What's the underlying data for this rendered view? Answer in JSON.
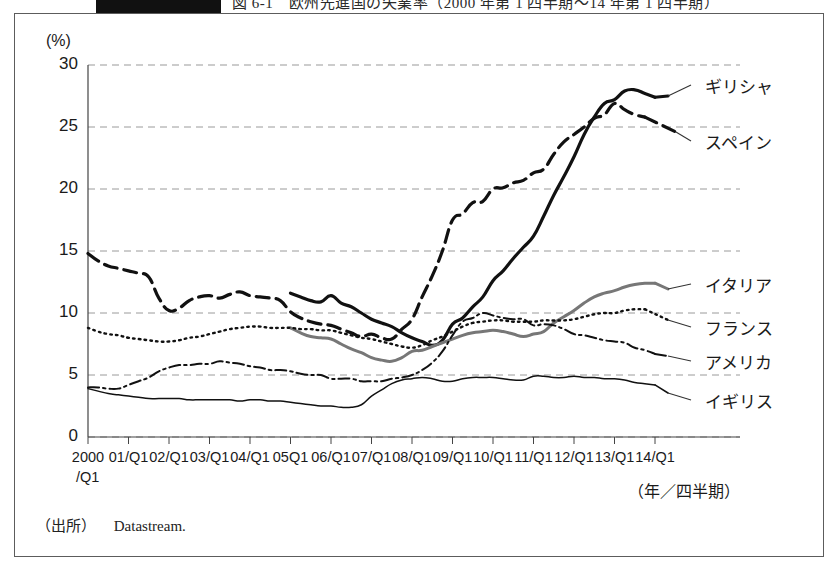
{
  "caption": {
    "tab_text": "",
    "title": "図 6-1　欧州先進国の失業率（2000 年第 1 四半期～14 年第 1 四半期）"
  },
  "axes": {
    "y_unit": "(%)",
    "y_ticks": [
      "30",
      "25",
      "20",
      "15",
      "10",
      "5",
      "0"
    ],
    "x_ticks": [
      "2000",
      "01/Q1",
      "02/Q1",
      "03/Q1",
      "04/Q1",
      "05Q1",
      "06/Q1",
      "07/Q1",
      "08/Q1",
      "09/Q1",
      "10/Q1",
      "11/Q1",
      "12/Q1",
      "13/Q1",
      "14/Q1"
    ],
    "x_first_sub": "/Q1",
    "x_title": "（年／四半期）"
  },
  "source": {
    "label": "（出所）",
    "value": "Datastream."
  },
  "chart_data": {
    "type": "line",
    "xlabel": "（年／四半期）",
    "ylabel": "(%)",
    "ylim": [
      0,
      30
    ],
    "ytick_step": 5,
    "grid": "horizontal-dashed",
    "legend_position": "right-inline-labels",
    "x": [
      "2000/Q1",
      "01/Q1",
      "02/Q1",
      "03/Q1",
      "04/Q1",
      "05/Q1",
      "06/Q1",
      "07/Q1",
      "08/Q1",
      "09/Q1",
      "10/Q1",
      "11/Q1",
      "12/Q1",
      "13/Q1",
      "14/Q1"
    ],
    "series": [
      {
        "name": "ギリシャ",
        "name_en": "Greece",
        "style": "solid-thick",
        "color": "#111111",
        "starts_at": "05/Q1",
        "values": [
          null,
          null,
          null,
          null,
          null,
          11.6,
          11.4,
          9.5,
          8.0,
          9.1,
          12.6,
          16.2,
          22.6,
          27.2,
          27.4
        ],
        "quarterly_values": [
          null,
          null,
          null,
          null,
          null,
          null,
          null,
          null,
          null,
          null,
          null,
          null,
          null,
          null,
          null,
          null,
          null,
          null,
          null,
          null,
          11.6,
          11.3,
          11.0,
          10.9,
          11.4,
          10.8,
          10.5,
          10.0,
          9.5,
          9.2,
          8.9,
          8.4,
          8.0,
          7.7,
          7.4,
          7.8,
          9.1,
          9.6,
          10.5,
          11.3,
          12.6,
          13.4,
          14.4,
          15.3,
          16.2,
          17.8,
          19.5,
          21.0,
          22.6,
          24.4,
          25.8,
          26.9,
          27.2,
          27.9,
          28.0,
          27.7,
          27.4
        ],
        "end_value": 27.4,
        "peak_value": 28.0
      },
      {
        "name": "スペイン",
        "name_en": "Spain",
        "style": "dashed-thick",
        "color": "#111111",
        "values": [
          14.8,
          13.4,
          10.2,
          11.4,
          11.4,
          10.1,
          9.0,
          8.3,
          9.5,
          17.5,
          20.0,
          21.3,
          24.4,
          26.9,
          25.8
        ],
        "quarterly_values": [
          14.8,
          14.2,
          13.8,
          13.6,
          13.4,
          13.2,
          12.9,
          11.2,
          10.2,
          10.4,
          11.0,
          11.3,
          11.4,
          11.2,
          11.5,
          11.7,
          11.4,
          11.3,
          11.2,
          11.0,
          10.1,
          9.6,
          9.3,
          9.1,
          9.0,
          8.7,
          8.4,
          8.1,
          8.3,
          8.0,
          7.9,
          8.7,
          9.5,
          11.3,
          13.0,
          15.0,
          17.5,
          18.0,
          18.9,
          19.0,
          20.0,
          20.1,
          20.5,
          20.7,
          21.3,
          21.6,
          22.8,
          23.8,
          24.4,
          25.0,
          25.7,
          26.0,
          26.9,
          26.4,
          26.0,
          25.8
        ],
        "end_value": 25.8,
        "peak_value": 26.9
      },
      {
        "name": "イタリア",
        "name_en": "Italy",
        "style": "solid-gray",
        "color": "#777777",
        "starts_at": "05/Q1",
        "values": [
          null,
          null,
          null,
          null,
          null,
          8.8,
          7.9,
          6.4,
          6.9,
          7.9,
          8.6,
          8.3,
          10.2,
          11.8,
          12.4
        ],
        "quarterly_values": [
          null,
          null,
          null,
          null,
          null,
          null,
          null,
          null,
          null,
          null,
          null,
          null,
          null,
          null,
          null,
          null,
          null,
          null,
          null,
          null,
          8.8,
          8.4,
          8.1,
          8.0,
          7.9,
          7.5,
          7.1,
          6.8,
          6.4,
          6.2,
          6.1,
          6.4,
          6.9,
          7.0,
          7.3,
          7.6,
          7.9,
          8.2,
          8.4,
          8.5,
          8.6,
          8.5,
          8.3,
          8.1,
          8.3,
          8.5,
          9.2,
          9.7,
          10.2,
          10.8,
          11.3,
          11.6,
          11.8,
          12.1,
          12.3,
          12.4,
          12.4
        ],
        "end_value": 12.4
      },
      {
        "name": "フランス",
        "name_en": "France",
        "style": "dotted",
        "color": "#111111",
        "values": [
          8.8,
          8.0,
          7.7,
          8.3,
          8.9,
          8.8,
          8.6,
          7.9,
          7.2,
          8.5,
          9.4,
          9.3,
          9.5,
          10.0,
          10.3
        ],
        "quarterly_values": [
          8.8,
          8.5,
          8.3,
          8.2,
          8.0,
          7.9,
          7.8,
          7.7,
          7.7,
          7.8,
          8.0,
          8.1,
          8.3,
          8.5,
          8.7,
          8.8,
          8.9,
          8.9,
          8.8,
          8.8,
          8.8,
          8.7,
          8.7,
          8.6,
          8.6,
          8.4,
          8.2,
          8.0,
          7.9,
          7.7,
          7.5,
          7.3,
          7.2,
          7.4,
          7.8,
          8.1,
          8.5,
          8.9,
          9.2,
          9.3,
          9.4,
          9.4,
          9.3,
          9.3,
          9.3,
          9.4,
          9.4,
          9.4,
          9.5,
          9.7,
          9.9,
          10.0,
          10.0,
          10.2,
          10.3,
          10.3
        ],
        "end_value": 10.3
      },
      {
        "name": "アメリカ",
        "name_en": "United States",
        "style": "dash-dot",
        "color": "#111111",
        "values": [
          4.0,
          4.2,
          5.6,
          5.9,
          5.7,
          5.3,
          4.7,
          4.5,
          5.0,
          8.2,
          9.8,
          9.0,
          8.3,
          7.7,
          6.7
        ],
        "quarterly_values": [
          4.0,
          4.0,
          3.9,
          3.9,
          4.2,
          4.5,
          4.8,
          5.3,
          5.6,
          5.8,
          5.8,
          5.9,
          5.9,
          6.1,
          6.0,
          5.9,
          5.7,
          5.6,
          5.4,
          5.4,
          5.3,
          5.1,
          5.0,
          5.0,
          4.7,
          4.7,
          4.7,
          4.5,
          4.5,
          4.5,
          4.7,
          4.8,
          5.0,
          5.4,
          6.0,
          6.9,
          8.2,
          9.3,
          9.6,
          10.0,
          9.8,
          9.6,
          9.5,
          9.5,
          9.0,
          9.1,
          9.0,
          8.7,
          8.3,
          8.2,
          8.0,
          7.8,
          7.7,
          7.6,
          7.2,
          7.0,
          6.7
        ],
        "end_value": 6.7,
        "peak_value": 10.0
      },
      {
        "name": "イギリス",
        "name_en": "United Kingdom",
        "style": "solid-thin",
        "color": "#111111",
        "values": [
          3.9,
          3.3,
          3.1,
          3.0,
          3.0,
          2.8,
          2.5,
          3.3,
          4.7,
          4.5,
          4.8,
          4.6,
          4.9,
          4.7,
          4.2
        ],
        "quarterly_values": [
          3.9,
          3.7,
          3.5,
          3.4,
          3.3,
          3.2,
          3.1,
          3.1,
          3.1,
          3.1,
          3.0,
          3.0,
          3.0,
          3.0,
          3.0,
          2.9,
          3.0,
          3.0,
          2.9,
          2.9,
          2.8,
          2.7,
          2.6,
          2.5,
          2.5,
          2.4,
          2.4,
          2.6,
          3.3,
          3.8,
          4.3,
          4.6,
          4.7,
          4.8,
          4.7,
          4.5,
          4.5,
          4.7,
          4.8,
          4.8,
          4.8,
          4.7,
          4.6,
          4.6,
          4.9,
          4.9,
          4.8,
          4.8,
          4.9,
          4.8,
          4.8,
          4.7,
          4.7,
          4.6,
          4.4,
          4.3,
          4.2
        ],
        "end_value": 4.2
      }
    ]
  }
}
